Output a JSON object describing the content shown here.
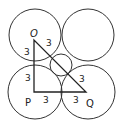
{
  "diagram": {
    "type": "geometry",
    "stroke_color": "#333333",
    "background": "#ffffff",
    "big_circles": [
      {
        "name": "top-left",
        "cx": 35,
        "cy": 35,
        "r": 26
      },
      {
        "name": "top-right",
        "cx": 88,
        "cy": 35,
        "r": 26
      },
      {
        "name": "bottom-left",
        "cx": 35,
        "cy": 92,
        "r": 27
      },
      {
        "name": "bottom-right",
        "cx": 88,
        "cy": 92,
        "r": 27
      }
    ],
    "small_circle": {
      "cx": 61,
      "cy": 65,
      "r": 11
    },
    "triangle": {
      "vertices": {
        "O": [
          34,
          40
        ],
        "P": [
          34,
          92
        ],
        "Q": [
          86,
          92
        ]
      }
    },
    "labels": {
      "O": "O",
      "P": "P",
      "Q": "Q",
      "seg_OP_upper": "3",
      "seg_OP_lower": "3",
      "seg_OQ_upper": "3",
      "seg_OQ_lower": "3",
      "seg_PQ_left": "3",
      "seg_PQ_right": "3"
    }
  }
}
